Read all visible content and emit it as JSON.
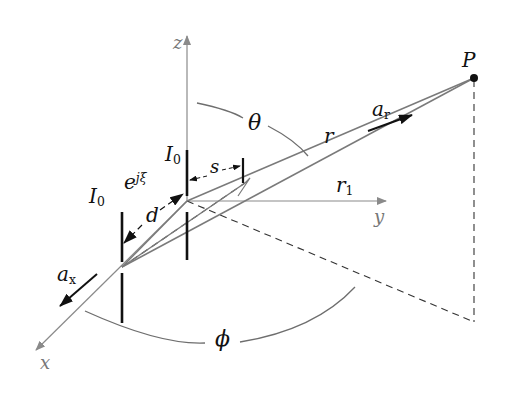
{
  "diagram": {
    "axes": {
      "x_label": "x",
      "y_label": "y",
      "z_label": "z"
    },
    "labels": {
      "point": "P",
      "r": "r",
      "r1_base": "r",
      "r1_sub": "1",
      "ar_base": "a",
      "ar_sub": "r",
      "ax_base": "a",
      "ax_sub": "x",
      "theta": "θ",
      "phi": "ϕ",
      "d": "d",
      "s": "s",
      "I0_top_base": "I",
      "I0_top_sub": "0",
      "I0_left_base": "I",
      "I0_left_sub": "0",
      "phase_base": "e",
      "phase_sup": "jξ"
    },
    "colors": {
      "axis": "#8a8a8a",
      "ray": "#7a7a7a",
      "dipole": "#111111",
      "arrow": "#111111",
      "arc": "#6e6e6e",
      "dashed": "#333333"
    }
  }
}
